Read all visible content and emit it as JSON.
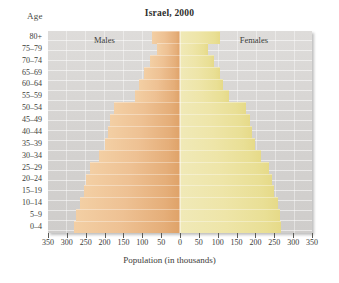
{
  "chart_data": {
    "type": "bar",
    "title": "Israel, 2000",
    "subtitle": "",
    "xlabel": "Population (in thousands)",
    "ylabel": "Age",
    "orientation": "horizontal-diverging",
    "layout": "population-pyramid",
    "grid": true,
    "legend_position": "in-plot",
    "xlim": [
      -350,
      350
    ],
    "xticks": [
      350,
      300,
      250,
      200,
      150,
      100,
      50,
      0,
      50,
      100,
      150,
      200,
      250,
      300,
      350
    ],
    "xtick_values": [
      -350,
      -300,
      -250,
      -200,
      -150,
      -100,
      -50,
      0,
      50,
      100,
      150,
      200,
      250,
      300,
      350
    ],
    "categories": [
      "80+",
      "75-79",
      "70-74",
      "65-69",
      "60-64",
      "55-59",
      "50-54",
      "45-49",
      "40-44",
      "35-39",
      "30-34",
      "25-29",
      "20-24",
      "15-19",
      "10-14",
      "5-9",
      "0-4"
    ],
    "series": [
      {
        "name": "Males",
        "color": "#e5b07c",
        "side": "left",
        "values": [
          75,
          60,
          80,
          95,
          110,
          120,
          175,
          185,
          190,
          200,
          215,
          240,
          250,
          255,
          265,
          275,
          280
        ]
      },
      {
        "name": "Females",
        "color": "#e9e09a",
        "side": "right",
        "values": [
          105,
          75,
          90,
          105,
          115,
          130,
          175,
          185,
          190,
          200,
          215,
          235,
          245,
          250,
          260,
          265,
          268
        ]
      }
    ],
    "annotations": [
      {
        "name": "males-label",
        "text": "Males"
      },
      {
        "name": "females-label",
        "text": "Females"
      }
    ]
  },
  "chart": {
    "title": "Israel, 2000",
    "age_axis_title": "Age",
    "x_axis_title": "Population (in thousands)",
    "males_label": "Males",
    "females_label": "Females",
    "age_groups": [
      "80+",
      "75-79",
      "70-74",
      "65-69",
      "60-64",
      "55-59",
      "50-54",
      "45-49",
      "40-44",
      "35-39",
      "30-34",
      "25-29",
      "20-24",
      "15-19",
      "10-14",
      "5-9",
      "0-4"
    ],
    "x_tick_labels": [
      "350",
      "300",
      "250",
      "200",
      "150",
      "100",
      "50",
      "0",
      "50",
      "100",
      "150",
      "200",
      "250",
      "300",
      "350"
    ],
    "colors": {
      "male_bar": "#e5b07c",
      "female_bar": "#e9e09a",
      "plot_background": "#d6d4d2",
      "text": "#3c3c39"
    }
  }
}
